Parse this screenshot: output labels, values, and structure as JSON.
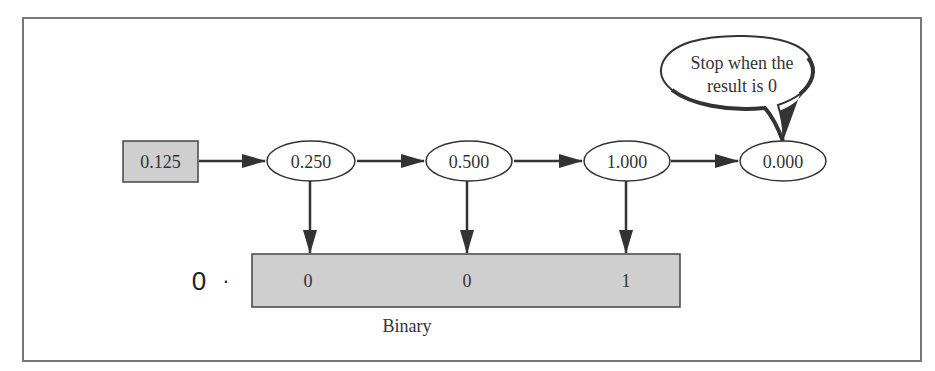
{
  "diagram": {
    "input": {
      "value": "0.125"
    },
    "steps": [
      {
        "value": "0.250",
        "bit": "0"
      },
      {
        "value": "0.500",
        "bit": "0"
      },
      {
        "value": "1.000",
        "bit": "1"
      },
      {
        "value": "0.000"
      }
    ],
    "callout": {
      "line1": "Stop when the",
      "line2": "result is 0"
    },
    "result": {
      "prefix_digit": "0",
      "prefix_point": "·",
      "bits": [
        "0",
        "0",
        "1"
      ],
      "label": "Binary"
    },
    "colors": {
      "frame": "#777777",
      "shaded_fill": "#cfcfcf",
      "stroke": "#333333",
      "arrow": "#333333"
    }
  }
}
